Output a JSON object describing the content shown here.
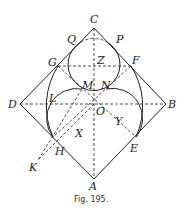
{
  "caption": "Fig. 195.",
  "labels": {
    "C": "C",
    "Q": "Q",
    "P": "P",
    "G": "G",
    "Z": "Z",
    "F": "F",
    "M": "M",
    "N": "N",
    "D": "D",
    "L": "L",
    "O": "O",
    "B": "B",
    "X": "X",
    "Y": "Y",
    "H": "H",
    "E": "E",
    "K": "K",
    "A": "A"
  },
  "colors": {
    "ink": "#222222",
    "background": "#ffffff"
  }
}
